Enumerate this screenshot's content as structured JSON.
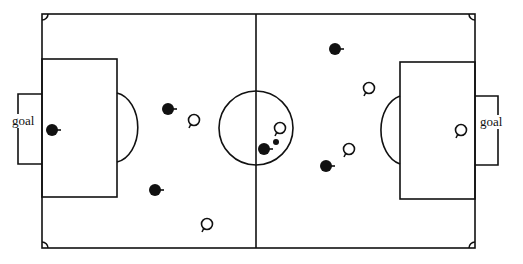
{
  "diagram": {
    "type": "soccer-field",
    "field": {
      "x": 42,
      "y": 14,
      "width": 433,
      "height": 234,
      "midline_x": 256
    },
    "center_circle": {
      "cx": 256,
      "cy": 128,
      "r": 37
    },
    "left_penalty_box": {
      "x": 42,
      "y": 59,
      "width": 75,
      "height": 138
    },
    "right_penalty_box": {
      "x": 400,
      "y": 62,
      "width": 75,
      "height": 137
    },
    "left_goal": {
      "x": 18,
      "y": 94,
      "width": 24,
      "height": 70,
      "label": "goal"
    },
    "right_goal": {
      "x": 475,
      "y": 96,
      "width": 23,
      "height": 69,
      "label": "goal"
    },
    "ball": {
      "cx": 276,
      "cy": 142,
      "r": 3
    },
    "team_filled": [
      {
        "cx": 52,
        "cy": 130
      },
      {
        "cx": 168,
        "cy": 109
      },
      {
        "cx": 155,
        "cy": 190
      },
      {
        "cx": 264,
        "cy": 149
      },
      {
        "cx": 335,
        "cy": 49
      },
      {
        "cx": 326,
        "cy": 166
      }
    ],
    "team_hollow": [
      {
        "cx": 194,
        "cy": 120
      },
      {
        "cx": 207,
        "cy": 224
      },
      {
        "cx": 280,
        "cy": 128
      },
      {
        "cx": 369,
        "cy": 88
      },
      {
        "cx": 349,
        "cy": 149
      },
      {
        "cx": 461,
        "cy": 130
      }
    ]
  },
  "labels": {
    "left_goal": "goal",
    "right_goal": "goal"
  },
  "colors": {
    "line": "#111111",
    "background": "#ffffff"
  }
}
